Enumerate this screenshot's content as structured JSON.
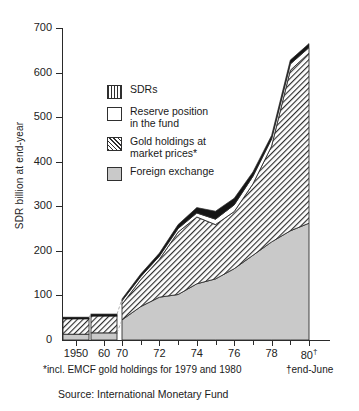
{
  "chart_data": {
    "type": "area",
    "title": "",
    "subtitle": "",
    "xlabel": "",
    "ylabel": "SDR billion at end-year",
    "ylim": [
      0,
      700
    ],
    "yticks": [
      0,
      100,
      200,
      300,
      400,
      500,
      600,
      700
    ],
    "ytick_labels": [
      "0",
      "100",
      "200",
      "300",
      "400",
      "500",
      "600",
      "700"
    ],
    "xlim": [
      1948,
      1981
    ],
    "xtick_labels": [
      "1950",
      "60",
      "70",
      "72",
      "74",
      "76",
      "78",
      "80"
    ],
    "xtick_years": [
      1950,
      1960,
      1970,
      1972,
      1974,
      1976,
      1978,
      1980
    ],
    "xtick_dagger_last": "†",
    "grid": false,
    "legend_position": "upper-left-inside",
    "stacked": true,
    "stack_order_bottom_to_top": [
      "Foreign exchange",
      "Gold holdings at market prices*",
      "Reserve position in the fund",
      "SDRs"
    ],
    "bars": [
      {
        "year": 1950,
        "foreign_exchange": 13,
        "gold": 35,
        "reserve_position": 3,
        "sdrs": 0,
        "total": 51
      },
      {
        "year": 1960,
        "foreign_exchange": 16,
        "gold": 38,
        "reserve_position": 4,
        "sdrs": 0,
        "total": 58
      }
    ],
    "x": [
      1970,
      1971,
      1972,
      1973,
      1974,
      1975,
      1976,
      1977,
      1978,
      1979,
      1980
    ],
    "series": [
      {
        "name": "Foreign exchange",
        "pattern": "solid-gray",
        "values": [
          45,
          75,
          96,
          102,
          126,
          137,
          160,
          190,
          220,
          245,
          262
        ]
      },
      {
        "name": "Gold holdings at market prices*",
        "pattern": "diagonal-hatch",
        "values": [
          35,
          60,
          85,
          140,
          150,
          122,
          128,
          160,
          215,
          360,
          382
        ]
      },
      {
        "name": "Reserve position in the fund",
        "pattern": "white",
        "values": [
          8,
          7,
          7,
          8,
          9,
          12,
          15,
          17,
          16,
          14,
          12
        ]
      },
      {
        "name": "SDRs",
        "pattern": "vertical-lines-dark",
        "values": [
          4,
          6,
          7,
          9,
          12,
          18,
          15,
          10,
          8,
          9,
          9
        ]
      }
    ],
    "totals": [
      92,
      148,
      195,
      259,
      297,
      289,
      318,
      377,
      459,
      628,
      665
    ],
    "annotations": [
      "peak total of about 665 at 1980 (end-June)",
      "local peak of about 297 at 1974 followed by a dip to about 289 in 1975"
    ]
  },
  "axis": {
    "y_title": "SDR billion at end-year"
  },
  "legend": {
    "items": [
      {
        "label": "SDRs",
        "swatch": "vertical-lines-swatch"
      },
      {
        "label": "Reserve position\nin the fund",
        "line1": "Reserve position",
        "line2": "in the fund",
        "swatch": "white-swatch"
      },
      {
        "label": "Gold holdings at\nmarket prices*",
        "line1": "Gold holdings at",
        "line2": "market prices*",
        "swatch": "diagonal-hatch-swatch"
      },
      {
        "label": "Foreign exchange",
        "swatch": "gray-fill-swatch"
      }
    ]
  },
  "footnotes": {
    "left": "*incl. EMCF gold holdings for 1979 and 1980",
    "right": "†end-June"
  },
  "source": {
    "text": "Source: International Monetary Fund"
  },
  "colors": {
    "ink": "#2f2f2f",
    "foreign_exchange_fill": "#c9c9c9",
    "gold_hatch": "#2f2f2f",
    "reserve_fill": "#ffffff",
    "sdrs_fill": "#151515",
    "background": "#ffffff"
  }
}
